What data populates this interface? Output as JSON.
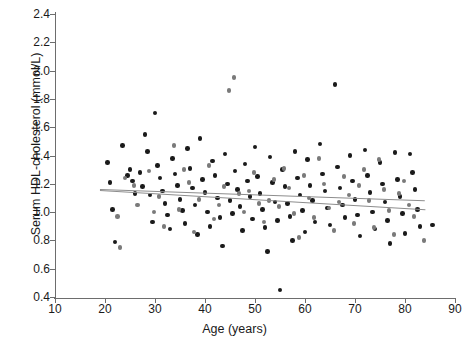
{
  "chart_data": {
    "type": "scatter",
    "title": "",
    "xlabel": "Age (years)",
    "ylabel": "Serum HDL-cholesterol  (mmol/L)",
    "xlim": [
      10,
      90
    ],
    "ylim": [
      0.4,
      2.4
    ],
    "xticks": [
      10,
      20,
      30,
      40,
      50,
      60,
      70,
      80,
      90
    ],
    "yticks": [
      0.4,
      0.6,
      0.8,
      1.0,
      1.2,
      1.4,
      1.6,
      1.8,
      2.0,
      2.2,
      2.4
    ],
    "xtick_labels": [
      "10",
      "20",
      "30",
      "40",
      "50",
      "60",
      "70",
      "80",
      "90"
    ],
    "ytick_labels": [
      "0.4",
      "0.6",
      "0.8",
      "1.0",
      "1.2",
      "1.4",
      "1.6",
      "1.8",
      "2.0",
      "2.2",
      "2.4"
    ],
    "grid": false,
    "legend": null,
    "marker_size_px": 4.6,
    "series": [
      {
        "name": "group-dark",
        "color": "#1a1a1a",
        "points": [
          [
            20.5,
            1.35
          ],
          [
            21.0,
            1.21
          ],
          [
            21.5,
            1.02
          ],
          [
            22.0,
            0.79
          ],
          [
            23.5,
            1.47
          ],
          [
            24.5,
            1.26
          ],
          [
            25.0,
            1.3
          ],
          [
            25.5,
            1.22
          ],
          [
            26.0,
            1.13
          ],
          [
            27.0,
            1.28
          ],
          [
            27.5,
            1.18
          ],
          [
            28.0,
            1.55
          ],
          [
            28.5,
            1.43
          ],
          [
            29.0,
            1.12
          ],
          [
            29.5,
            0.93
          ],
          [
            30.0,
            1.7
          ],
          [
            30.5,
            1.33
          ],
          [
            31.0,
            1.24
          ],
          [
            31.5,
            1.15
          ],
          [
            32.0,
            1.06
          ],
          [
            32.5,
            0.98
          ],
          [
            33.0,
            0.88
          ],
          [
            33.5,
            1.38
          ],
          [
            34.0,
            1.27
          ],
          [
            34.5,
            1.19
          ],
          [
            35.0,
            1.09
          ],
          [
            35.5,
            1.01
          ],
          [
            36.0,
            0.92
          ],
          [
            36.5,
            1.45
          ],
          [
            37.0,
            1.31
          ],
          [
            37.5,
            1.17
          ],
          [
            38.0,
            1.05
          ],
          [
            38.5,
            0.84
          ],
          [
            39.0,
            1.52
          ],
          [
            39.5,
            1.23
          ],
          [
            40.0,
            1.14
          ],
          [
            40.5,
            1.0
          ],
          [
            41.0,
            0.9
          ],
          [
            41.5,
            1.36
          ],
          [
            42.0,
            1.26
          ],
          [
            42.5,
            1.1
          ],
          [
            43.0,
            0.96
          ],
          [
            43.5,
            0.76
          ],
          [
            44.0,
            1.41
          ],
          [
            44.5,
            1.2
          ],
          [
            45.0,
            1.08
          ],
          [
            45.5,
            0.99
          ],
          [
            46.0,
            1.29
          ],
          [
            46.5,
            1.16
          ],
          [
            47.0,
            1.04
          ],
          [
            47.5,
            0.87
          ],
          [
            48.0,
            1.34
          ],
          [
            48.5,
            1.22
          ],
          [
            49.0,
            1.11
          ],
          [
            49.5,
            0.95
          ],
          [
            50.0,
            1.46
          ],
          [
            50.5,
            1.25
          ],
          [
            51.0,
            1.13
          ],
          [
            51.5,
            1.02
          ],
          [
            52.0,
            0.89
          ],
          [
            52.5,
            0.72
          ],
          [
            53.0,
            1.39
          ],
          [
            53.5,
            1.21
          ],
          [
            54.0,
            1.07
          ],
          [
            54.5,
            0.94
          ],
          [
            55.0,
            0.45
          ],
          [
            55.5,
            1.3
          ],
          [
            56.0,
            1.18
          ],
          [
            56.5,
            1.06
          ],
          [
            57.0,
            0.97
          ],
          [
            57.5,
            0.8
          ],
          [
            58.0,
            1.43
          ],
          [
            58.5,
            1.24
          ],
          [
            59.0,
            1.12
          ],
          [
            59.5,
            1.01
          ],
          [
            60.0,
            0.86
          ],
          [
            60.5,
            1.37
          ],
          [
            61.0,
            1.19
          ],
          [
            61.5,
            1.08
          ],
          [
            62.0,
            0.93
          ],
          [
            63.0,
            1.48
          ],
          [
            63.5,
            1.27
          ],
          [
            64.0,
            1.15
          ],
          [
            64.5,
            1.03
          ],
          [
            65.0,
            0.91
          ],
          [
            66.0,
            1.9
          ],
          [
            66.5,
            1.32
          ],
          [
            67.0,
            1.17
          ],
          [
            67.5,
            1.05
          ],
          [
            68.0,
            0.96
          ],
          [
            69.0,
            1.4
          ],
          [
            69.5,
            1.22
          ],
          [
            70.0,
            1.09
          ],
          [
            70.5,
            0.98
          ],
          [
            71.0,
            0.83
          ],
          [
            72.0,
            1.44
          ],
          [
            72.5,
            1.26
          ],
          [
            73.0,
            1.14
          ],
          [
            73.5,
            1.0
          ],
          [
            74.0,
            0.88
          ],
          [
            75.0,
            1.35
          ],
          [
            75.5,
            1.2
          ],
          [
            76.0,
            1.07
          ],
          [
            76.5,
            0.94
          ],
          [
            77.0,
            0.78
          ],
          [
            78.0,
            1.42
          ],
          [
            78.5,
            1.23
          ],
          [
            79.0,
            1.11
          ],
          [
            79.5,
            0.99
          ],
          [
            80.0,
            0.85
          ],
          [
            81.0,
            1.41
          ],
          [
            81.5,
            1.28
          ],
          [
            82.0,
            1.16
          ],
          [
            82.5,
            1.02
          ],
          [
            83.0,
            0.9
          ],
          [
            85.5,
            0.91
          ]
        ]
      },
      {
        "name": "group-gray",
        "color": "#7a7a7a",
        "points": [
          [
            22.5,
            0.97
          ],
          [
            23.0,
            0.75
          ],
          [
            24.0,
            1.24
          ],
          [
            26.5,
            1.05
          ],
          [
            28.8,
            1.29
          ],
          [
            30.8,
            1.11
          ],
          [
            31.8,
            0.9
          ],
          [
            33.8,
            1.47
          ],
          [
            34.8,
            1.02
          ],
          [
            36.8,
            1.21
          ],
          [
            38.8,
            1.09
          ],
          [
            40.8,
            1.33
          ],
          [
            41.8,
            0.95
          ],
          [
            43.8,
            1.18
          ],
          [
            44.8,
            1.86
          ],
          [
            45.8,
            1.95
          ],
          [
            46.8,
            1.13
          ],
          [
            47.8,
            1.0
          ],
          [
            49.8,
            1.28
          ],
          [
            50.8,
            1.06
          ],
          [
            51.8,
            0.93
          ],
          [
            53.8,
            1.23
          ],
          [
            54.8,
            1.04
          ],
          [
            55.8,
            1.31
          ],
          [
            56.8,
            1.17
          ],
          [
            57.8,
            0.99
          ],
          [
            58.8,
            0.82
          ],
          [
            59.8,
            1.26
          ],
          [
            60.8,
            1.1
          ],
          [
            61.8,
            0.96
          ],
          [
            62.8,
            1.38
          ],
          [
            63.8,
            1.2
          ],
          [
            64.8,
            1.03
          ],
          [
            65.8,
            0.87
          ],
          [
            67.8,
            1.25
          ],
          [
            68.8,
            1.12
          ],
          [
            69.8,
            0.92
          ],
          [
            71.8,
            1.3
          ],
          [
            72.8,
            1.08
          ],
          [
            73.8,
            0.89
          ],
          [
            74.8,
            1.37
          ],
          [
            75.8,
            1.16
          ],
          [
            76.8,
            1.01
          ],
          [
            77.8,
            0.84
          ],
          [
            79.8,
            1.22
          ],
          [
            80.8,
            1.05
          ],
          [
            81.8,
            0.97
          ],
          [
            83.8,
            0.8
          ],
          [
            25.8,
            1.19
          ],
          [
            29.8,
            1.0
          ],
          [
            35.8,
            1.3
          ],
          [
            37.8,
            0.86
          ],
          [
            42.8,
            1.05
          ],
          [
            48.8,
            1.15
          ],
          [
            52.8,
            1.08
          ],
          [
            66.8,
            1.07
          ],
          [
            70.8,
            1.19
          ],
          [
            78.8,
            1.13
          ]
        ]
      }
    ],
    "trendlines": [
      {
        "name": "trend-upper",
        "x0": 19.0,
        "y0": 1.165,
        "x1": 84.0,
        "y1": 1.085,
        "color": "#8d8d8d"
      },
      {
        "name": "trend-lower",
        "x0": 19.0,
        "y0": 1.155,
        "x1": 84.0,
        "y1": 1.02,
        "color": "#8d8d8d"
      }
    ]
  }
}
